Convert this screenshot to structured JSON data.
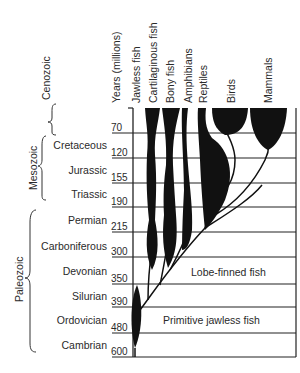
{
  "header": {
    "years_label": "Years (millions)",
    "groups": [
      "Jawless fish",
      "Cartilaginous fish",
      "Bony fish",
      "Amphibians",
      "Reptiles",
      "Birds",
      "Mammals"
    ]
  },
  "eras": [
    "Cenozoic",
    "Mesozoic",
    "Paleozoic"
  ],
  "periods": [
    "Cretaceous",
    "Jurassic",
    "Triassic",
    "Permian",
    "Carboniferous",
    "Devonian",
    "Silurian",
    "Ordovician",
    "Cambrian"
  ],
  "years": [
    "70",
    "120",
    "155",
    "190",
    "215",
    "300",
    "350",
    "390",
    "480",
    "600"
  ],
  "annotations": {
    "lobe_finned": "Lobe-finned fish",
    "primitive_jawless": "Primitive jawless fish"
  }
}
